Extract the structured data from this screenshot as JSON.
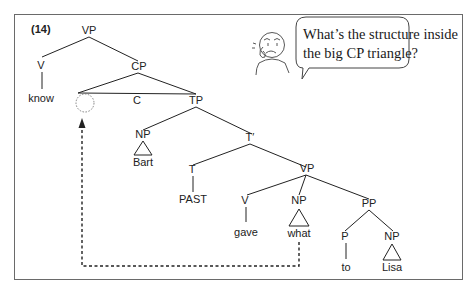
{
  "example_number": "(14)",
  "nodes": {
    "vp_top": "VP",
    "v_top": "V",
    "know": "know",
    "cp": "CP",
    "c": "C",
    "tp": "TP",
    "np_subj": "NP",
    "bart": "Bart",
    "t_bar": "T′",
    "t": "T",
    "past": "PAST",
    "vp_low": "VP",
    "v_low": "V",
    "gave": "gave",
    "np_obj": "NP",
    "what": "what",
    "pp": "PP",
    "p": "P",
    "to": "to",
    "np_lisa": "NP",
    "lisa": "Lisa"
  },
  "speech_bubble": {
    "line1": "What’s the structure inside",
    "line2": "the big CP triangle?"
  },
  "icons": {
    "thinker": "puzzled-person-icon",
    "empty_spec": "dotted-circle-empty-position-icon",
    "movement_arrow": "dashed-movement-arrow-icon"
  }
}
